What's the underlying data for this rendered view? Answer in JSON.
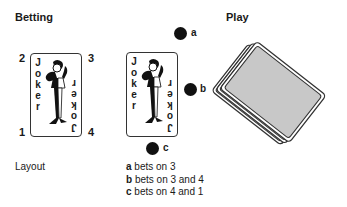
{
  "sections": {
    "betting": {
      "title": "Betting"
    },
    "play": {
      "title": "Play"
    }
  },
  "card": {
    "word_letters": [
      "J",
      "o",
      "k",
      "e",
      "r"
    ]
  },
  "layout": {
    "caption": "Layout",
    "corner_labels": {
      "top_left": "2",
      "top_right": "3",
      "bottom_left": "1",
      "bottom_right": "4"
    }
  },
  "chips": [
    {
      "id": "a",
      "label": "a"
    },
    {
      "id": "b",
      "label": "b"
    },
    {
      "id": "c",
      "label": "c"
    }
  ],
  "legend": [
    {
      "key": "a",
      "text": " bets on 3"
    },
    {
      "key": "b",
      "text": " bets on 3 and 4"
    },
    {
      "key": "c",
      "text": " bets on 4 and 1"
    }
  ],
  "colors": {
    "chip": "#111111",
    "card_back": "#c8c8c8",
    "outline": "#333333"
  }
}
